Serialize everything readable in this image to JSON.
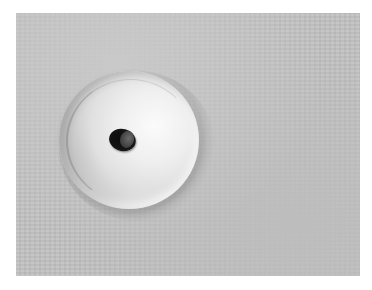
{
  "image": {
    "subject": "pit crater with dark circular hole on a flat dusty surface",
    "colors": {
      "background": "#ffffff",
      "surface": "#c2c2c2",
      "crater_highlight": "#f4f4f4",
      "hole": "#111111"
    }
  }
}
